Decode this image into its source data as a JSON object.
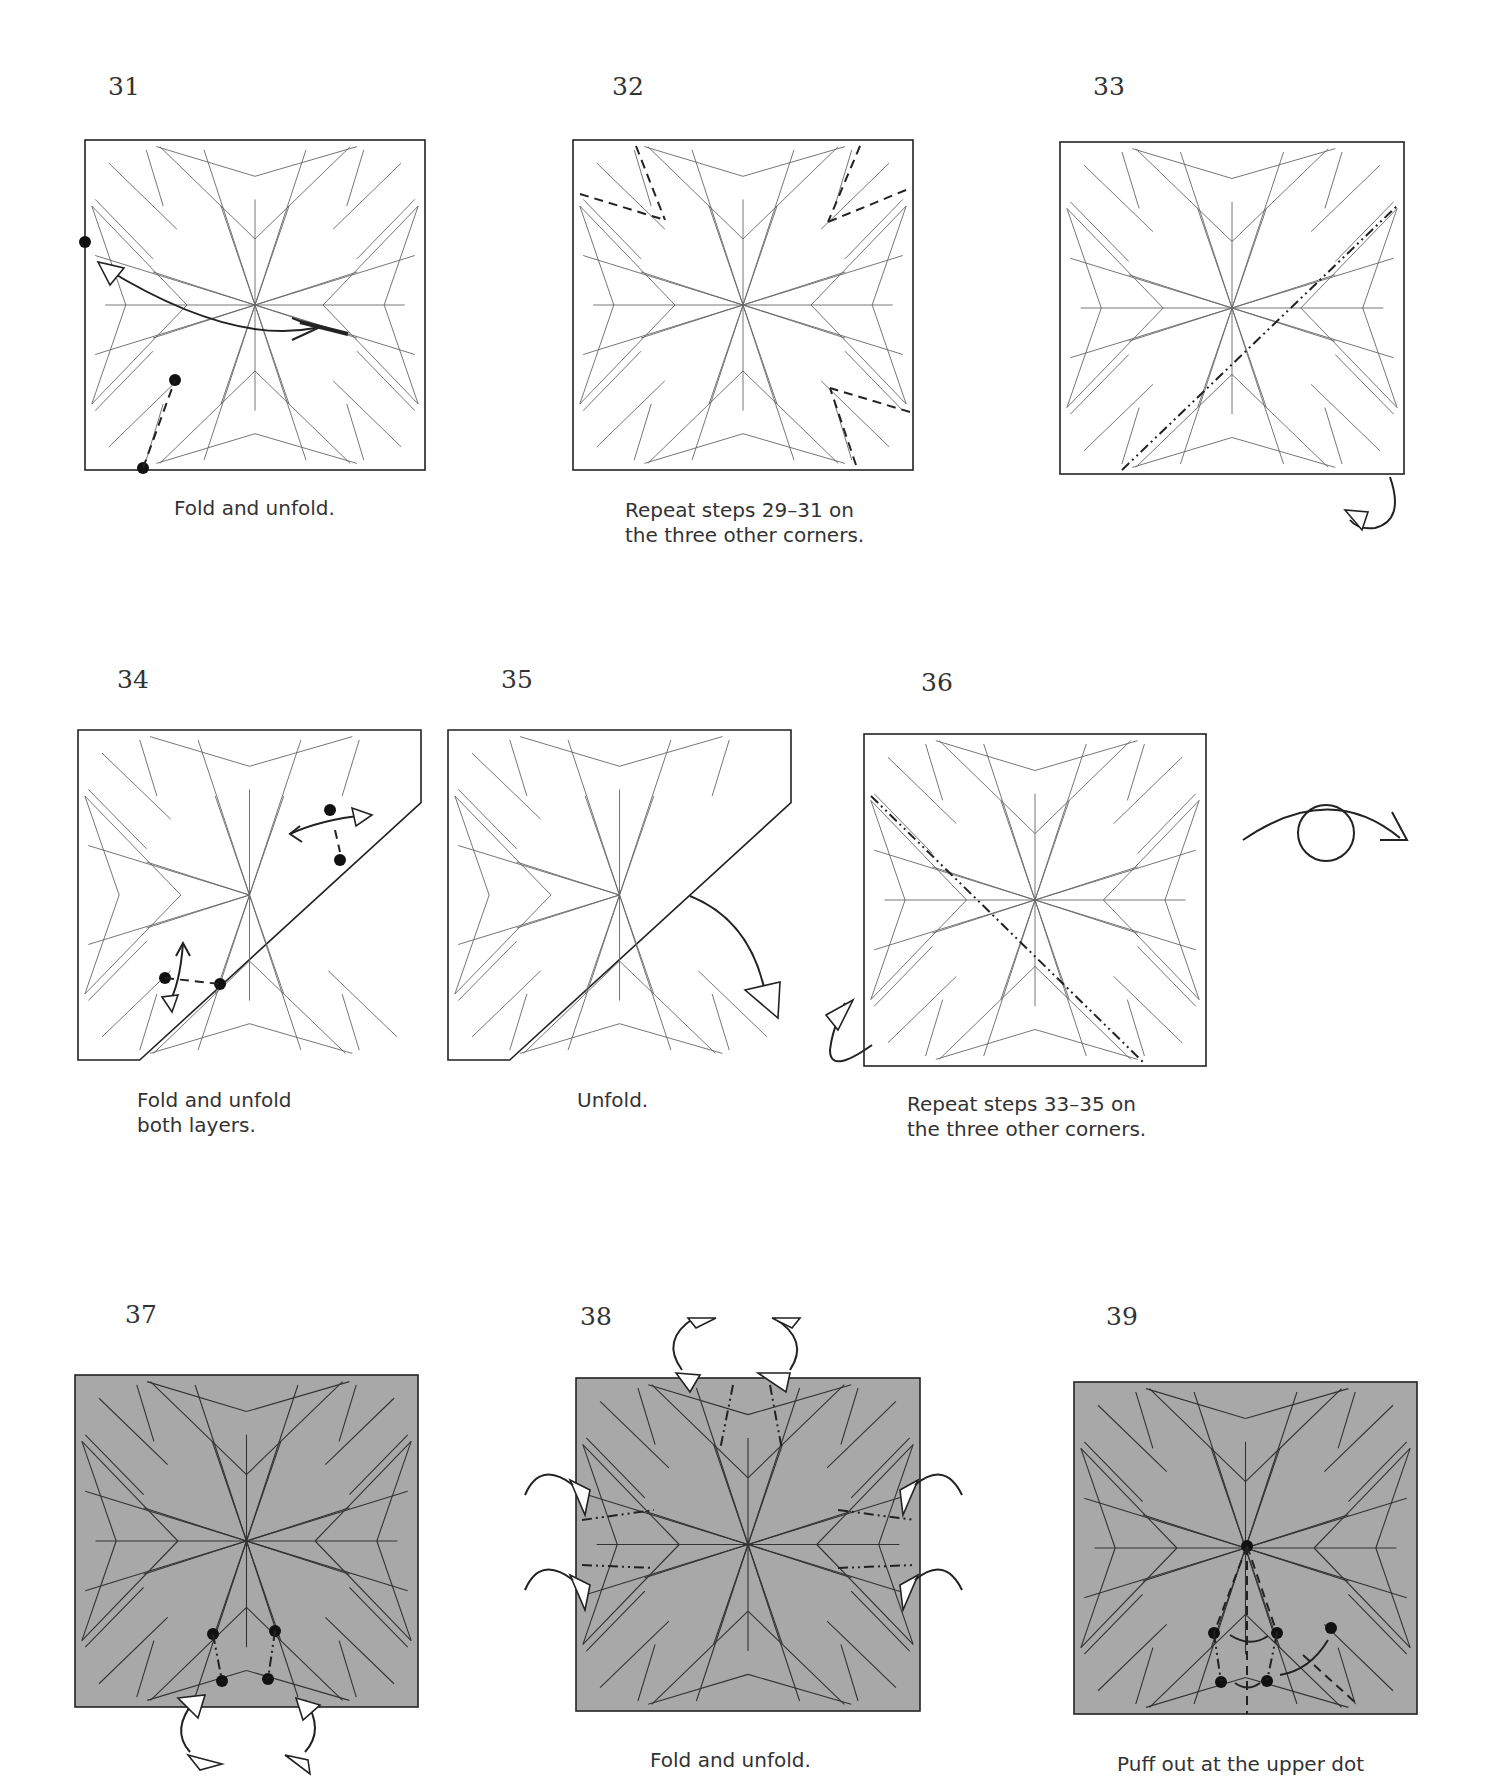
{
  "page": {
    "colors": {
      "paper_white": "#ffffff",
      "paper_colored": "#a8a8a8",
      "line": "#3a3a3a",
      "crease": "#555555",
      "dot": "#111111"
    },
    "steps": [
      {
        "number": "31",
        "caption": [
          "Fold and unfold."
        ],
        "paper": "white",
        "shape": "square",
        "symbols": [
          "valley-fold-line",
          "dot",
          "dot",
          "dot",
          "fold-unfold-arrow"
        ]
      },
      {
        "number": "32",
        "caption": [
          "Repeat steps 29–31 on",
          "the three other corners."
        ],
        "paper": "white",
        "shape": "square",
        "symbols": [
          "valley-fold-line",
          "valley-fold-line",
          "valley-fold-line"
        ]
      },
      {
        "number": "33",
        "caption": [],
        "paper": "white",
        "shape": "square",
        "symbols": [
          "mountain-fold-line",
          "mountain-fold-arrow"
        ]
      },
      {
        "number": "34",
        "caption": [
          "Fold and unfold",
          "both layers."
        ],
        "paper": "white",
        "shape": "folded-corner",
        "symbols": [
          "valley-fold-line",
          "dot",
          "dot",
          "dot",
          "dot",
          "fold-unfold-arrow",
          "fold-unfold-arrow"
        ]
      },
      {
        "number": "35",
        "caption": [
          "Unfold."
        ],
        "paper": "white",
        "shape": "folded-corner",
        "symbols": [
          "unfold-arrow"
        ]
      },
      {
        "number": "36",
        "caption": [
          "Repeat steps 33–35 on",
          "the three other corners."
        ],
        "paper": "white",
        "shape": "square",
        "symbols": [
          "mountain-fold-line",
          "mountain-fold-arrow",
          "turn-over-arrow"
        ]
      },
      {
        "number": "37",
        "caption": [],
        "paper": "colored",
        "shape": "square",
        "symbols": [
          "dot",
          "dot",
          "dot",
          "dot",
          "sink-arrow",
          "sink-arrow"
        ]
      },
      {
        "number": "38",
        "caption": [
          "Fold and unfold."
        ],
        "paper": "colored",
        "shape": "square",
        "symbols": [
          "mountain-fold-line",
          "sink-arrow"
        ]
      },
      {
        "number": "39",
        "caption": [
          "Puff out at the upper dot"
        ],
        "paper": "colored",
        "shape": "square",
        "symbols": [
          "dot",
          "dot",
          "dot",
          "dot",
          "dot",
          "dot",
          "move-arrow"
        ]
      }
    ]
  }
}
